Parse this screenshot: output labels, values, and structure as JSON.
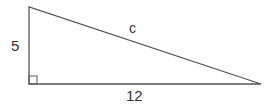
{
  "diagram": {
    "type": "right-triangle",
    "labels": {
      "vertical_leg": "5",
      "hypotenuse": "c",
      "horizontal_leg": "12"
    },
    "right_angle_marker": true,
    "stroke_color": "#555555"
  }
}
